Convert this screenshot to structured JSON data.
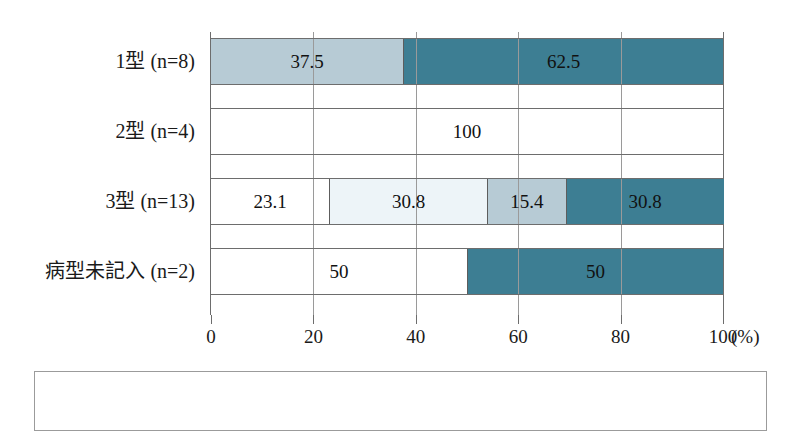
{
  "chart_data": {
    "type": "bar",
    "orientation": "horizontal",
    "stacked": true,
    "normalized_percent": true,
    "title": "",
    "xlabel": "(%)",
    "ylabel": "",
    "xlim": [
      0,
      100
    ],
    "xticks": [
      0,
      20,
      40,
      60,
      80,
      100
    ],
    "xtick_labels": [
      "0",
      "20",
      "40",
      "60",
      "80",
      "100"
    ],
    "unit": "(%)",
    "grid": true,
    "legend": "none",
    "categories": [
      "1型 (n=8)",
      "2型 (n=4)",
      "3型 (n=13)",
      "病型未記入 (n=2)"
    ],
    "category_parts": [
      {
        "name": "1型",
        "n_prefix": "(",
        "n_symbol": "n",
        "n_eq": "=",
        "n_value": "8",
        "n_suffix": ")"
      },
      {
        "name": "2型",
        "n_prefix": "(",
        "n_symbol": "n",
        "n_eq": "=",
        "n_value": "4",
        "n_suffix": ")"
      },
      {
        "name": "3型",
        "n_prefix": "(",
        "n_symbol": "n",
        "n_eq": "=",
        "n_value": "13",
        "n_suffix": ")"
      },
      {
        "name": "病型未記入",
        "n_prefix": "(",
        "n_symbol": "n",
        "n_eq": "=",
        "n_value": "2",
        "n_suffix": ")"
      }
    ],
    "colors": {
      "white": "#ffffff",
      "pale_blue": "#edf4f8",
      "light_blue_gray": "#b7cbd5",
      "dark_teal": "#3d7e93"
    },
    "bars": [
      {
        "category": "1型 (n=8)",
        "segments": [
          {
            "value": 37.5,
            "label": "37.5",
            "color": "#b7cbd5"
          },
          {
            "value": 62.5,
            "label": "62.5",
            "color": "#3d7e93"
          }
        ]
      },
      {
        "category": "2型 (n=4)",
        "segments": [
          {
            "value": 100,
            "label": "100",
            "color": "#ffffff"
          }
        ]
      },
      {
        "category": "3型 (n=13)",
        "segments": [
          {
            "value": 23.1,
            "label": "23.1",
            "color": "#ffffff"
          },
          {
            "value": 30.8,
            "label": "30.8",
            "color": "#edf4f8"
          },
          {
            "value": 15.4,
            "label": "15.4",
            "color": "#b7cbd5"
          },
          {
            "value": 30.8,
            "label": "30.8",
            "color": "#3d7e93"
          }
        ]
      },
      {
        "category": "病型未記入 (n=2)",
        "segments": [
          {
            "value": 50,
            "label": "50",
            "color": "#ffffff"
          },
          {
            "value": 50,
            "label": "50",
            "color": "#3d7e93"
          }
        ]
      }
    ]
  }
}
